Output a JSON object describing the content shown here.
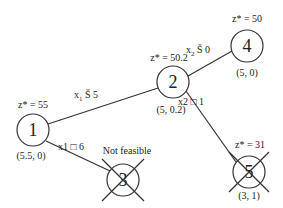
{
  "diagram": {
    "type": "branch-and-bound tree",
    "nodes": [
      {
        "id": "1",
        "label": "1",
        "z": "z* = 55",
        "solution": "(5.5, 0)",
        "status": "active"
      },
      {
        "id": "2",
        "label": "2",
        "z": "z* = 50.2",
        "solution": "(5, 0.2)",
        "status": "active"
      },
      {
        "id": "3",
        "label": "3",
        "z": "",
        "solution": "",
        "status": "Not feasible"
      },
      {
        "id": "4",
        "label": "4",
        "z": "z* = 50",
        "solution": "(5, 0)",
        "status": "active"
      },
      {
        "id": "5",
        "label": "5",
        "z": "z* = 31",
        "solution": "(3, 1)",
        "status": "fathomed"
      }
    ],
    "edges": [
      {
        "from": "1",
        "to": "2",
        "constraint_var": "x",
        "constraint_sub": "1",
        "constraint_rest": " Š 5"
      },
      {
        "from": "1",
        "to": "3",
        "constraint_var": "x1",
        "constraint_sub": "",
        "constraint_rest": " □ 6"
      },
      {
        "from": "2",
        "to": "4",
        "constraint_var": "x",
        "constraint_sub": "2",
        "constraint_rest": " Š 0"
      },
      {
        "from": "2",
        "to": "5",
        "constraint_var": "x2",
        "constraint_sub": "",
        "constraint_rest": " □ 1"
      }
    ],
    "not_feasible_label": "Not feasible",
    "line_color": "#333333"
  }
}
